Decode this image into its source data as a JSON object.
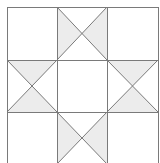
{
  "diagram": {
    "type": "quilt-block",
    "grid": {
      "rows": 3,
      "cols": 3,
      "x_lines": [
        7,
        57,
        107,
        158
      ],
      "y_lines": [
        7,
        60,
        112,
        164
      ]
    },
    "colors": {
      "background": "#ffffff",
      "line": "#7a7a7a",
      "shade": "#ececec"
    },
    "cells": [
      {
        "row": 0,
        "col": 0,
        "kind": "plain"
      },
      {
        "row": 0,
        "col": 1,
        "kind": "quarter-square",
        "shaded": [
          "left",
          "right"
        ]
      },
      {
        "row": 0,
        "col": 2,
        "kind": "plain"
      },
      {
        "row": 1,
        "col": 0,
        "kind": "quarter-square",
        "shaded": [
          "top",
          "bottom"
        ]
      },
      {
        "row": 1,
        "col": 1,
        "kind": "plain"
      },
      {
        "row": 1,
        "col": 2,
        "kind": "quarter-square",
        "shaded": [
          "top",
          "bottom"
        ]
      },
      {
        "row": 2,
        "col": 0,
        "kind": "plain"
      },
      {
        "row": 2,
        "col": 1,
        "kind": "quarter-square",
        "shaded": [
          "left",
          "right"
        ]
      },
      {
        "row": 2,
        "col": 2,
        "kind": "plain"
      }
    ]
  }
}
